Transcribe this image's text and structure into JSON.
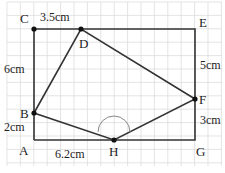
{
  "diagram": {
    "points": {
      "A": "A",
      "B": "B",
      "C": "C",
      "D": "D",
      "E": "E",
      "F": "F",
      "G": "G",
      "H": "H"
    },
    "measurements": {
      "CD": "3.5cm",
      "CB": "6cm",
      "BA": "2cm",
      "AH": "6.2cm",
      "EF": "5cm",
      "FG": "3cm"
    },
    "colors": {
      "grid": "#d8d8d8",
      "line": "#333333",
      "arc": "#888888"
    }
  }
}
